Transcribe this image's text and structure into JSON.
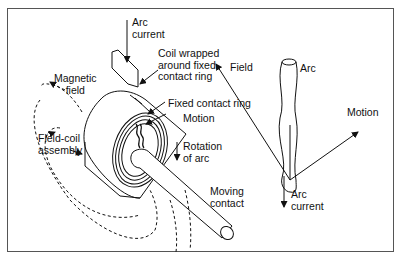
{
  "diagram": {
    "left_panel": {
      "labels": {
        "arc_current_top": "Arc\ncurrent",
        "coil_wrapped": "Coil wrapped\naround fixed\ncontact ring",
        "magnetic_field": "Magnetic\nfield",
        "fixed_contact_ring": "Fixed contact ring",
        "motion": "Motion",
        "field_coil_assembly": "Field-coil\nassembly",
        "rotation_of_arc": "Rotation\nof arc",
        "moving_contact": "Moving\ncontact"
      }
    },
    "right_panel": {
      "labels": {
        "field": "Field",
        "arc": "Arc",
        "motion": "Motion",
        "arc_current": "Arc\ncurrent"
      }
    },
    "colors": {
      "line": "#111111",
      "frame": "#555555",
      "background": "#ffffff"
    }
  }
}
